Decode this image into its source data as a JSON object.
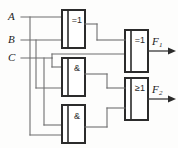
{
  "diagram": {
    "type": "digital-logic-schematic",
    "colors": {
      "wire": "#6f6f6f",
      "gate_outline": "#2b2b2b",
      "background": "#fdfdfc",
      "label": "#1c1c1c"
    }
  },
  "inputs": [
    {
      "id": "A",
      "label": "A",
      "y": 17
    },
    {
      "id": "B",
      "label": "B",
      "y": 40
    },
    {
      "id": "C",
      "label": "C",
      "y": 58
    }
  ],
  "outputs": [
    {
      "id": "F1",
      "base": "F",
      "sub": "1",
      "y": 51
    },
    {
      "id": "F2",
      "base": "F",
      "sub": "2",
      "y": 99
    }
  ],
  "gates": [
    {
      "id": "G1",
      "symbol": "=1",
      "kind": "xor",
      "x": 62,
      "y": 10,
      "w": 23,
      "h": 38,
      "inputs": [
        "A",
        "B"
      ],
      "output": "G1out"
    },
    {
      "id": "G2",
      "symbol": "&",
      "kind": "and",
      "x": 62,
      "y": 58,
      "w": 23,
      "h": 38,
      "inputs": [
        "C",
        "B"
      ],
      "output": "G2out"
    },
    {
      "id": "G3",
      "symbol": "&",
      "kind": "and",
      "x": 62,
      "y": 105,
      "w": 23,
      "h": 38,
      "inputs": [
        "A",
        "C"
      ],
      "output": "G3out"
    },
    {
      "id": "G4",
      "symbol": "=1",
      "kind": "xor",
      "x": 125,
      "y": 30,
      "w": 23,
      "h": 42,
      "inputs": [
        "G1out",
        "C"
      ],
      "output": "F1"
    },
    {
      "id": "G5",
      "symbol": "≥1",
      "kind": "or",
      "x": 125,
      "y": 78,
      "w": 23,
      "h": 42,
      "inputs": [
        "G2out",
        "G3out"
      ],
      "output": "F2"
    }
  ],
  "bus_lines": [
    {
      "signal": "A",
      "x": 30
    },
    {
      "signal": "B",
      "x": 36
    },
    {
      "signal": "C",
      "x": 44
    }
  ]
}
